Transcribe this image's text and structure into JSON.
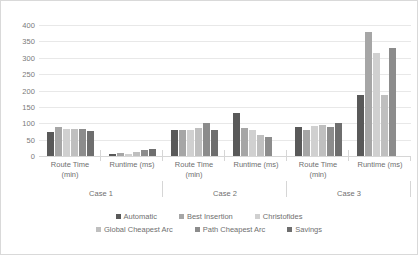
{
  "chart_data": {
    "type": "bar",
    "title": "",
    "xlabel": "",
    "ylabel": "",
    "ylim": [
      0,
      400
    ],
    "ytick_step": 50,
    "yticks": [
      "400",
      "350",
      "300",
      "250",
      "200",
      "150",
      "100",
      "50",
      "0"
    ],
    "grid": true,
    "legend_position": "bottom",
    "categories": [
      "Route Time (min)",
      "Runtime (ms)",
      "Route Time (min)",
      "Runtime (ms)",
      "Route Time (min)",
      "Runtime (ms)"
    ],
    "category_lines": [
      [
        "Route Time",
        "(min)"
      ],
      [
        "Runtime (ms)",
        ""
      ],
      [
        "Route Time",
        "(min)"
      ],
      [
        "Runtime (ms)",
        ""
      ],
      [
        "Route Time",
        "(min)"
      ],
      [
        "Runtime (ms)",
        ""
      ]
    ],
    "groups": [
      "Case 1",
      "Case 2",
      "Case 3"
    ],
    "series": [
      {
        "name": "Automatic",
        "color": "#595959",
        "values": [
          72,
          5,
          80,
          130,
          90,
          185
        ]
      },
      {
        "name": "Best Insertion",
        "color": "#a6a6a6",
        "values": [
          90,
          8,
          80,
          85,
          80,
          380
        ]
      },
      {
        "name": "Christofides",
        "color": "#d0d0d0",
        "values": [
          82,
          7,
          80,
          80,
          92,
          315
        ]
      },
      {
        "name": "Global Cheapest Arc",
        "color": "#bfbfbf",
        "values": [
          82,
          12,
          85,
          65,
          95,
          185
        ]
      },
      {
        "name": "Path Cheapest Arc",
        "color": "#8c8c8c",
        "values": [
          82,
          17,
          100,
          58,
          88,
          330
        ]
      },
      {
        "name": "Savings",
        "color": "#6e6e6e",
        "values": [
          75,
          20,
          78,
          0,
          100,
          0
        ]
      }
    ]
  },
  "axis": {
    "y_color": "#7a7a7a",
    "grid_color": "#e8e8e8"
  }
}
